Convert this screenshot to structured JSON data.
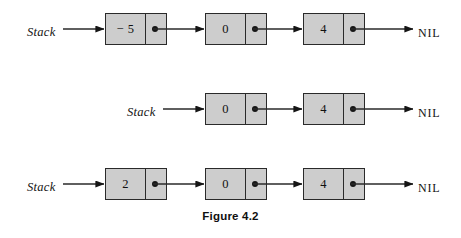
{
  "figure": {
    "caption": "Figure 4.2",
    "nil_label": "NIL",
    "stack_label": "Stack",
    "colors": {
      "node_fill": "#cdcdcd",
      "node_border": "#2a2a2a",
      "ink": "#121212",
      "background": "#ffffff"
    }
  },
  "rows": [
    {
      "name": "row-1-three-nodes",
      "stack_label": "Stack",
      "nil_label": "NIL",
      "nodes": [
        {
          "value": "− 5",
          "pointer": "dot"
        },
        {
          "value": "0",
          "pointer": "dot"
        },
        {
          "value": "4",
          "pointer": "dot"
        }
      ]
    },
    {
      "name": "row-2-two-nodes",
      "stack_label": "Stack",
      "nil_label": "NIL",
      "nodes": [
        {
          "value": "0",
          "pointer": "dot"
        },
        {
          "value": "4",
          "pointer": "dot"
        }
      ]
    },
    {
      "name": "row-3-three-nodes",
      "stack_label": "Stack",
      "nil_label": "NIL",
      "nodes": [
        {
          "value": "2",
          "pointer": "dot"
        },
        {
          "value": "0",
          "pointer": "dot"
        },
        {
          "value": "4",
          "pointer": "dot"
        }
      ]
    }
  ]
}
